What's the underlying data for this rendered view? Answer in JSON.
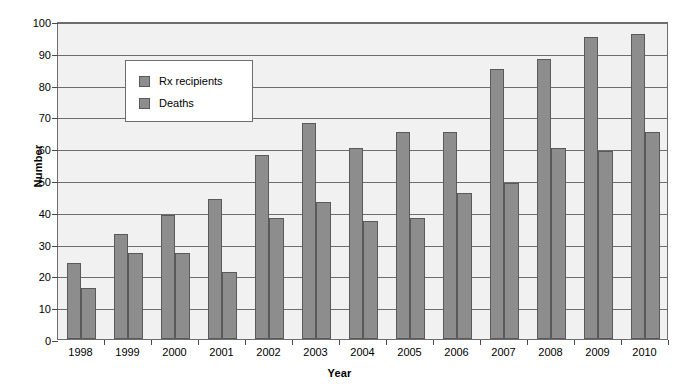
{
  "chart_data": {
    "type": "bar",
    "title": "",
    "xlabel": "Year",
    "ylabel": "Number",
    "categories": [
      "1998",
      "1999",
      "2000",
      "2001",
      "2002",
      "2003",
      "2004",
      "2005",
      "2006",
      "2007",
      "2008",
      "2009",
      "2010"
    ],
    "series": [
      {
        "name": "Rx recipients",
        "values": [
          24,
          33,
          39,
          44,
          58,
          68,
          60,
          65,
          65,
          85,
          88,
          95,
          96
        ]
      },
      {
        "name": "Deaths",
        "values": [
          16,
          27,
          27,
          21,
          38,
          43,
          37,
          38,
          46,
          49,
          60,
          59,
          65
        ]
      }
    ],
    "ylim": [
      0,
      100
    ],
    "yticks": [
      0,
      10,
      20,
      30,
      40,
      50,
      60,
      70,
      80,
      90,
      100
    ],
    "ytick_labels": [
      "0",
      "10",
      "20",
      "30",
      "40",
      "50",
      "60",
      "70",
      "80",
      "90",
      "100"
    ],
    "grid": true,
    "legend_position": "upper-left-inside",
    "colors": {
      "bar_fill": "#8d8d8d",
      "bar_stroke": "#5a5a5a",
      "plot_background": "#f1f1f1",
      "gridline": "#6d6d6d",
      "legend_background": "#ffffff",
      "text": "#000000"
    }
  }
}
